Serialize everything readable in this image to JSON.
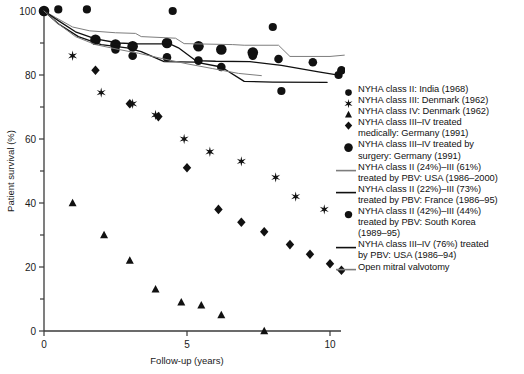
{
  "axes": {
    "ylabel": "Patient survival (%)",
    "xlabel": "Follow-up (years)",
    "yticks": [
      "0",
      "20",
      "40",
      "60",
      "80",
      "100"
    ],
    "xticks": [
      "0",
      "5",
      "10"
    ],
    "ylim": [
      0,
      100
    ],
    "xlim": [
      0,
      10.6
    ]
  },
  "colors": {
    "ink": "#111111",
    "gray_line": "#7d7d7d",
    "black_line": "#101010",
    "axis": "#3a3a3a"
  },
  "legend": [
    {
      "marker": "circle-small",
      "lines": [
        "NYHA class II: India (1968)"
      ]
    },
    {
      "marker": "star",
      "lines": [
        "NYHA class III: Denmark (1962)"
      ]
    },
    {
      "marker": "triangle",
      "lines": [
        "NYHA class IV: Denmark (1962)"
      ]
    },
    {
      "marker": "diamond",
      "lines": [
        "NYHA class III–IV treated",
        "medically: Germany (1991)"
      ]
    },
    {
      "marker": "circle-large",
      "lines": [
        "NYHA class III–IV treated by",
        "surgery: Germany (1991)"
      ]
    },
    {
      "marker": "line-gray",
      "lines": [
        "NYHA class II (24%)–III (61%)",
        "treated by PBV: USA (1986–2000)"
      ]
    },
    {
      "marker": "line-dark",
      "lines": [
        "NYHA class II (22%)–III (73%)",
        "treated by PBV: France (1986–95)"
      ]
    },
    {
      "marker": "circle-medium",
      "lines": [
        "NYHA class II (42%)–III (44%)",
        "treated by PBV: South Korea",
        "(1989–95)"
      ]
    },
    {
      "marker": "line-dark",
      "lines": [
        "NYHA class III–IV (76%) treated",
        "by PBV: USA (1986–94)"
      ]
    },
    {
      "marker": "line-gray",
      "lines": [
        "Open mitral valvotomy"
      ]
    }
  ],
  "chart_data": {
    "type": "scatter",
    "title": "",
    "xlabel": "Follow-up (years)",
    "ylabel": "Patient survival (%)",
    "xlim": [
      0,
      10.6
    ],
    "ylim": [
      0,
      100
    ],
    "grid": false,
    "legend_position": "right",
    "series": [
      {
        "name": "NYHA class II: India (1968)",
        "marker": "circle-small",
        "points": [
          [
            0,
            100
          ],
          [
            0.5,
            100.5
          ],
          [
            1.5,
            100.5
          ],
          [
            4.5,
            100
          ],
          [
            8.0,
            95
          ],
          [
            8.3,
            75
          ],
          [
            10.3,
            80
          ]
        ]
      },
      {
        "name": "NYHA class III: Denmark (1962)",
        "marker": "star",
        "points": [
          [
            0,
            100
          ],
          [
            1.0,
            86
          ],
          [
            2.0,
            74.5
          ],
          [
            3.1,
            71
          ],
          [
            3.9,
            67.5
          ],
          [
            4.9,
            60
          ],
          [
            5.8,
            56
          ],
          [
            6.9,
            53
          ],
          [
            8.1,
            48
          ],
          [
            8.8,
            42
          ],
          [
            9.8,
            38
          ]
        ]
      },
      {
        "name": "NYHA class IV: Denmark (1962)",
        "marker": "triangle",
        "points": [
          [
            0,
            100
          ],
          [
            1.0,
            40
          ],
          [
            2.1,
            30
          ],
          [
            3.0,
            22
          ],
          [
            3.9,
            13
          ],
          [
            4.8,
            9
          ],
          [
            5.5,
            8
          ],
          [
            6.2,
            5
          ],
          [
            7.7,
            0
          ]
        ]
      },
      {
        "name": "NYHA class III–IV treated medically: Germany (1991)",
        "marker": "diamond",
        "points": [
          [
            0,
            100
          ],
          [
            1.8,
            81.5
          ],
          [
            3.0,
            71
          ],
          [
            4.0,
            67
          ],
          [
            5.0,
            51
          ],
          [
            6.1,
            38
          ],
          [
            6.9,
            34
          ],
          [
            7.7,
            31
          ],
          [
            8.6,
            27
          ],
          [
            9.3,
            24
          ],
          [
            10.0,
            21
          ],
          [
            10.4,
            19
          ]
        ]
      },
      {
        "name": "NYHA class III–IV treated by surgery: Germany (1991)",
        "marker": "circle-large",
        "points": [
          [
            0,
            100
          ],
          [
            1.8,
            91
          ],
          [
            2.5,
            89.5
          ],
          [
            3.1,
            89
          ],
          [
            4.3,
            90
          ],
          [
            5.4,
            89
          ],
          [
            6.2,
            88
          ],
          [
            7.3,
            87
          ]
        ]
      },
      {
        "name": "NYHA class II (42%)–III (44%) treated by PBV: South Korea",
        "marker": "circle-medium",
        "points": [
          [
            0,
            100
          ],
          [
            2.5,
            88
          ],
          [
            3.1,
            86
          ],
          [
            4.3,
            85.5
          ],
          [
            5.4,
            84.5
          ],
          [
            6.2,
            82.5
          ],
          [
            7.3,
            86
          ],
          [
            8.2,
            85
          ],
          [
            9.4,
            84
          ],
          [
            10.4,
            81.5
          ]
        ]
      },
      {
        "name": "NYHA class II (24%)–III (61%) treated by PBV: USA (1986–2000)",
        "marker": "line-gray",
        "path": [
          [
            0,
            100
          ],
          [
            0.4,
            98
          ],
          [
            1.0,
            95
          ],
          [
            1.6,
            93.8
          ],
          [
            2.5,
            93.2
          ],
          [
            3.2,
            93.0
          ],
          [
            3.4,
            92.0
          ],
          [
            4.6,
            91.5
          ],
          [
            4.9,
            89.8
          ],
          [
            6.6,
            89.5
          ],
          [
            7.0,
            89.3
          ],
          [
            8.2,
            89.3
          ],
          [
            8.6,
            85.8
          ],
          [
            10.0,
            85.8
          ],
          [
            10.5,
            86.2
          ]
        ]
      },
      {
        "name": "NYHA class II (22%)–III (73%) treated by PBV: France (1986–95)",
        "marker": "line-dark",
        "path": [
          [
            0,
            100
          ],
          [
            0.5,
            97
          ],
          [
            1.1,
            93.5
          ],
          [
            1.8,
            91.3
          ],
          [
            2.6,
            90.0
          ],
          [
            3.3,
            89.7
          ],
          [
            4.4,
            89.7
          ],
          [
            4.7,
            88.5
          ],
          [
            5.3,
            84.5
          ],
          [
            6.0,
            84.3
          ],
          [
            7.2,
            84.2
          ],
          [
            8.3,
            83.0
          ],
          [
            9.6,
            81.0
          ],
          [
            10.4,
            79.8
          ]
        ]
      },
      {
        "name": "NYHA class III–IV (76%) treated by PBV: USA (1986–94)",
        "marker": "line-dark",
        "path": [
          [
            0,
            100
          ],
          [
            0.5,
            96
          ],
          [
            1.2,
            92
          ],
          [
            2.0,
            89.5
          ],
          [
            2.9,
            88.5
          ],
          [
            3.4,
            87.3
          ],
          [
            4.2,
            84.2
          ],
          [
            5.3,
            84.0
          ],
          [
            6.2,
            82.5
          ],
          [
            7.0,
            78.0
          ],
          [
            8.0,
            77.8
          ],
          [
            9.9,
            77.7
          ]
        ]
      },
      {
        "name": "Open mitral valvotomy",
        "marker": "line-gray",
        "path": [
          [
            0,
            100
          ],
          [
            0.5,
            96
          ],
          [
            1.1,
            92
          ],
          [
            1.8,
            89.5
          ],
          [
            2.6,
            88.0
          ],
          [
            3.3,
            86.8
          ],
          [
            4.2,
            85.0
          ],
          [
            5.0,
            83.5
          ],
          [
            5.9,
            82.0
          ],
          [
            6.8,
            80.5
          ],
          [
            7.6,
            79.8
          ]
        ]
      }
    ]
  }
}
